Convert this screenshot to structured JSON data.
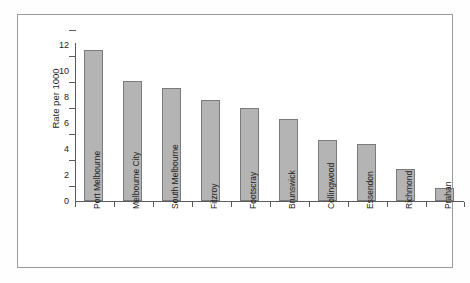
{
  "chart_data": {
    "type": "bar",
    "title": "",
    "subtitle": "",
    "xlabel": "",
    "ylabel": "Rate per 1000",
    "categories": [
      "Port Melbourne",
      "Melbourne City",
      "South Melbourne",
      "Fitzroy",
      "Footscray",
      "Brunswick",
      "Collingwood",
      "Essendon",
      "Richmond",
      "Prahan"
    ],
    "values": [
      11.5,
      9.15,
      8.55,
      7.65,
      7.1,
      6.2,
      4.6,
      4.3,
      2.4,
      1.0
    ],
    "ylim": [
      0,
      12
    ],
    "yticks": [
      0,
      2,
      4,
      6,
      8,
      10,
      12
    ],
    "ytick_labels": [
      "0",
      "2",
      "4",
      "6",
      "8",
      "10",
      "12"
    ],
    "grid": false,
    "legend": null,
    "legend_position": "none",
    "bar_fill_color": "#b4b4b4",
    "bar_edge_color": "#7b7b7b",
    "axis_color": "#5a5a5a",
    "frame_color": "#9a9a9a",
    "background_color": "#ffffff",
    "annotations": []
  }
}
